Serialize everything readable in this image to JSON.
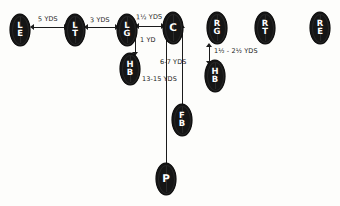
{
  "diagram": {
    "type": "football-punt-formation-alignment",
    "players": [
      {
        "id": "left-end",
        "abbr": "LE",
        "lines": [
          "L",
          "E"
        ],
        "x": 10,
        "y": 14
      },
      {
        "id": "left-tackle",
        "abbr": "LT",
        "lines": [
          "L",
          "T"
        ],
        "x": 65,
        "y": 14
      },
      {
        "id": "left-guard",
        "abbr": "LG",
        "lines": [
          "L",
          "G"
        ],
        "x": 117,
        "y": 14
      },
      {
        "id": "center",
        "abbr": "C",
        "lines": [
          "C"
        ],
        "x": 163,
        "y": 12
      },
      {
        "id": "right-guard",
        "abbr": "RG",
        "lines": [
          "R",
          "G"
        ],
        "x": 207,
        "y": 12
      },
      {
        "id": "right-tackle",
        "abbr": "RT",
        "lines": [
          "R",
          "T"
        ],
        "x": 255,
        "y": 12
      },
      {
        "id": "right-end",
        "abbr": "RE",
        "lines": [
          "R",
          "E"
        ],
        "x": 310,
        "y": 12
      },
      {
        "id": "halfback-left",
        "abbr": "HB",
        "lines": [
          "H",
          "B"
        ],
        "x": 120,
        "y": 53
      },
      {
        "id": "halfback-right",
        "abbr": "HB",
        "lines": [
          "H",
          "B"
        ],
        "x": 205,
        "y": 60
      },
      {
        "id": "fullback",
        "abbr": "FB",
        "lines": [
          "F",
          "B"
        ],
        "x": 172,
        "y": 104
      },
      {
        "id": "punter",
        "abbr": "P",
        "lines": [
          "P"
        ],
        "x": 156,
        "y": 163
      }
    ],
    "measurements": [
      {
        "id": "le-to-lt-split",
        "text": "5 YDS",
        "x": 38,
        "y": 15
      },
      {
        "id": "lt-to-lg-split",
        "text": "3 YDS",
        "x": 88,
        "y": 16
      },
      {
        "id": "lg-to-c-split",
        "text": "1½ YDS",
        "x": 135,
        "y": 13
      },
      {
        "id": "lg-to-hb-depth",
        "text": "1 YD",
        "x": 141,
        "y": 36
      },
      {
        "id": "c-to-fb-depth",
        "text": "6-7 YDS",
        "x": 163,
        "y": 58
      },
      {
        "id": "c-to-p-depth",
        "text": "13-15 YDS",
        "x": 143,
        "y": 74
      },
      {
        "id": "rg-to-hb-depth",
        "text": "1½ - 2½ YDS",
        "x": 213,
        "y": 46
      }
    ]
  }
}
